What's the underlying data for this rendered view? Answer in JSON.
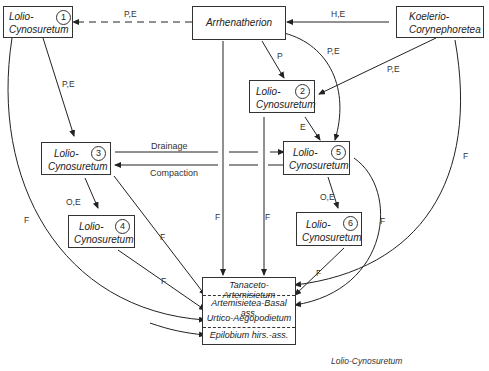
{
  "nodes": {
    "n1": {
      "line1": "Lolio-",
      "line2": "Cynosuretum",
      "num": "1"
    },
    "arrhenatherion": {
      "label": "Arrhenatherion"
    },
    "koelerio": {
      "line1": "Koelerio-",
      "line2": "Corynephoretea"
    },
    "n2": {
      "line1": "Lolio-",
      "line2": "Cynosuretum",
      "num": "2"
    },
    "n3": {
      "line1": "Lolio-",
      "line2": "Cynosuretum",
      "num": "3"
    },
    "n4": {
      "line1": "Lolio-",
      "line2": "Cynosuretum",
      "num": "4"
    },
    "n5": {
      "line1": "Lolio-",
      "line2": "Cynosuretum",
      "num": "5"
    },
    "n6": {
      "line1": "Lolio-",
      "line2": "Cynosuretum",
      "num": "6"
    }
  },
  "target_box": {
    "rows": [
      "Tanaceto-Artemisietum",
      "Artemisietea-Basal ass.",
      "Urtico-Aegopodietum",
      "Epilobium hirs.-ass."
    ]
  },
  "edge_labels": {
    "arr_to_1": "P,E",
    "koel_to_arr": "H,E",
    "arr_to_2": "P",
    "arr_to_5": "P,E",
    "koel_to_2": "P,E",
    "n1_to_3": "P,E",
    "n2_to_5": "E",
    "drainage": "Drainage",
    "compaction": "Compaction",
    "n3_to_4": "O,E",
    "n5_to_6": "O,E",
    "f": "F"
  },
  "caption": "Lolio-Cynosuretum"
}
